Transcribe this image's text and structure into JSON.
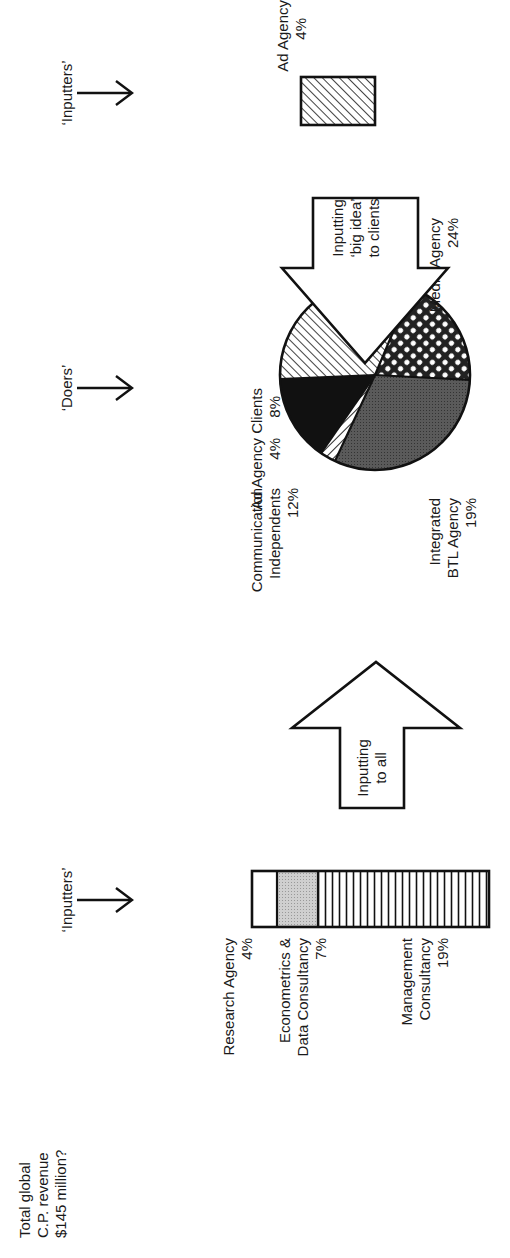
{
  "title": {
    "line1": "Total global",
    "line2": "C.P. revenue",
    "line3": "$145 million?"
  },
  "sections": {
    "left_inputters": "‘Inputters’",
    "doers": "‘Doers’",
    "right_inputters": "‘Inputters’"
  },
  "stacked_bar": {
    "segments": [
      {
        "label_lines": [
          "Research Agency",
          "4%"
        ],
        "value": 4,
        "fill": "white"
      },
      {
        "label_lines": [
          "Econometrics &",
          "Data Consultancy",
          "7%"
        ],
        "value": 7,
        "fill": "light-grey-dots"
      },
      {
        "label_lines": [
          "Management",
          "Consultancy",
          "19%"
        ],
        "value": 19,
        "fill": "vertical-stripes"
      }
    ]
  },
  "arrows": {
    "to_all": {
      "line1": "Inputting",
      "line2": "to all"
    },
    "big_idea": {
      "line1": "Inputting",
      "line2": "‘big idea’",
      "line3": "to clients"
    }
  },
  "pie": {
    "slices": [
      {
        "label_lines": [
          "Media Agency",
          "24%"
        ],
        "value": 24,
        "fill": "diagonal-hatch"
      },
      {
        "label_lines": [
          "Integrated",
          "BTL Agency",
          "19%"
        ],
        "value": 19,
        "fill": "checker"
      },
      {
        "label_lines": [
          "Communication",
          "Independents",
          "12%"
        ],
        "value": 12,
        "fill": "dark-grey"
      },
      {
        "label_lines": [
          "Ad Agency",
          "4%"
        ],
        "value": 4,
        "fill": "back-hatch"
      },
      {
        "label_lines": [
          "Clients",
          "8%"
        ],
        "value": 8,
        "fill": "black"
      }
    ]
  },
  "ad_agency_box": {
    "label_lines": [
      "Ad Agency",
      "4%"
    ],
    "value": 4,
    "fill": "diagonal-hatch"
  }
}
